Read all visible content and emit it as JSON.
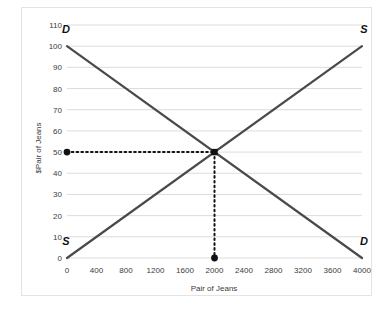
{
  "chart_data": {
    "type": "line",
    "title": "",
    "xlabel": "Pair of Jeans",
    "ylabel": "$Pair of Jeans",
    "xlim": [
      0,
      4000
    ],
    "ylim": [
      0,
      110
    ],
    "grid": "horizontal",
    "legend": "none",
    "x_ticks": [
      "0",
      "400",
      "800",
      "1200",
      "1600",
      "2000",
      "2400",
      "2800",
      "3200",
      "3600",
      "4000"
    ],
    "y_ticks": [
      "0",
      "10",
      "20",
      "30",
      "40",
      "50",
      "60",
      "70",
      "80",
      "90",
      "100",
      "110"
    ],
    "series": [
      {
        "name": "Demand",
        "label": "D",
        "label_start": "D",
        "label_end": "D",
        "x": [
          0,
          4000
        ],
        "values": [
          100,
          0
        ],
        "color": "#4a4a4a"
      },
      {
        "name": "Supply",
        "label": "S",
        "label_start": "S",
        "label_end": "S",
        "x": [
          0,
          4000
        ],
        "values": [
          0,
          100
        ],
        "color": "#4a4a4a"
      }
    ],
    "annotations": [
      {
        "name": "equilibrium-point",
        "x": 2000,
        "y": 50,
        "marker": "square",
        "color": "#111111"
      },
      {
        "name": "equilibrium-price-marker",
        "x": 0,
        "y": 50,
        "marker": "dot",
        "color": "#111111"
      },
      {
        "name": "equilibrium-quantity-marker",
        "x": 2000,
        "y": 0,
        "marker": "dot",
        "color": "#111111"
      }
    ],
    "guides": [
      {
        "name": "equilibrium-price-guide",
        "orientation": "horizontal",
        "from": [
          0,
          50
        ],
        "to": [
          2000,
          50
        ],
        "style": "dotted"
      },
      {
        "name": "equilibrium-quantity-guide",
        "orientation": "vertical",
        "from": [
          2000,
          50
        ],
        "to": [
          2000,
          0
        ],
        "style": "dotted"
      }
    ],
    "curve_labels": [
      {
        "text": "D",
        "x": 0,
        "y": 106,
        "position": "top-left"
      },
      {
        "text": "S",
        "x": 4000,
        "y": 106,
        "position": "top-right"
      },
      {
        "text": "S",
        "x": 0,
        "y": 6,
        "position": "bottom-left"
      },
      {
        "text": "D",
        "x": 4000,
        "y": 6,
        "position": "bottom-right"
      }
    ]
  }
}
